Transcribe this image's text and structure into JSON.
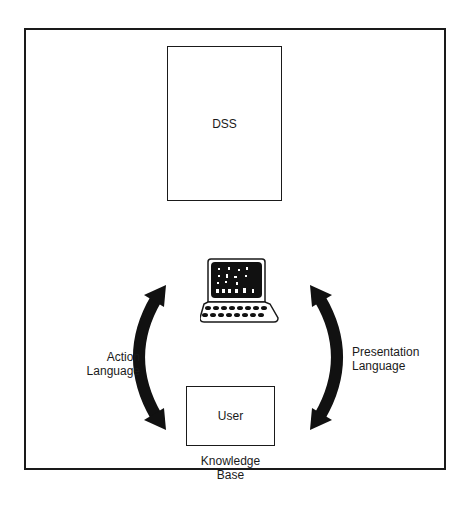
{
  "diagram": {
    "nodes": [
      {
        "id": "dss",
        "label": "DSS"
      },
      {
        "id": "user",
        "label": "User"
      },
      {
        "id": "terminal",
        "label": "",
        "icon": "computer-terminal-icon"
      }
    ],
    "labels": {
      "action": [
        "Action",
        "Language"
      ],
      "presentation": [
        "Presentation",
        "Language"
      ],
      "knowledge_base": [
        "Knowledge",
        "Base"
      ]
    },
    "edges": [
      {
        "from": "user",
        "to": "terminal",
        "label": "Action Language",
        "style": "curved-double-arrow"
      },
      {
        "from": "terminal",
        "to": "user",
        "label": "Presentation Language",
        "style": "curved-double-arrow"
      }
    ],
    "colors": {
      "line": "#1a1a1a",
      "background": "#ffffff"
    }
  }
}
